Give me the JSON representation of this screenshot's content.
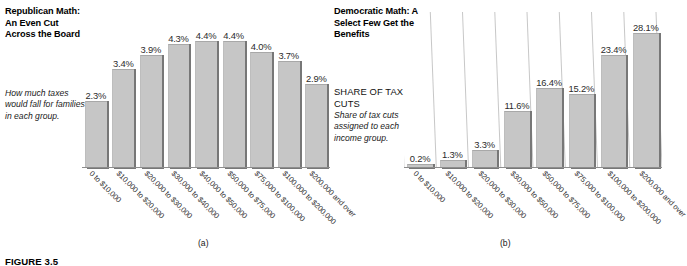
{
  "figure": {
    "caption": "FIGURE 3.5"
  },
  "panel_a": {
    "title": "Republican Math: An Even Cut Across the Board",
    "note": "How much taxes would fall for families in each group.",
    "subcaption": "(a)"
  },
  "panel_b": {
    "title": "Democratic Math: A Select Few Get the Benefits",
    "share_label": "SHARE OF TAX CUTS",
    "note": "Share of tax cuts assigned to each income group.",
    "subcaption": "(b)"
  },
  "chart_data": [
    {
      "type": "bar",
      "title": "Republican Math: An Even Cut Across the Board",
      "xlabel": "",
      "ylabel": "",
      "ylim": [
        0,
        5.0
      ],
      "grid": false,
      "legend": "none",
      "categories": [
        "0 to $10,000",
        "$10,000 to $20,000",
        "$20,000 to $30,000",
        "$30,000 to $40,000",
        "$40,000 to $50,000",
        "$50,000 to $75,000",
        "$75,000 to $100,000",
        "$100,000 to $200,000",
        "$200,000 and over"
      ],
      "values": [
        2.3,
        3.4,
        3.9,
        4.3,
        4.4,
        4.4,
        4.0,
        3.7,
        2.9
      ],
      "labels": [
        "2.3%",
        "3.4%",
        "3.9%",
        "4.3%",
        "4.4%",
        "4.4%",
        "4.0%",
        "3.7%",
        "2.9%"
      ],
      "bar_color": "#c6c6c6",
      "shadow_color": "#777777"
    },
    {
      "type": "bar",
      "title": "Democratic Math: A Select Few Get the Benefits",
      "xlabel": "",
      "ylabel": "SHARE OF TAX CUTS",
      "ylim": [
        0,
        30.0
      ],
      "grid": true,
      "legend": "none",
      "categories": [
        "0 to $10,000",
        "$10,000 to $20,000",
        "$20,000 to $30,000",
        "$30,000 to $50,000",
        "$50,000 to $75,000",
        "$75,000 to $100,000",
        "$100,000 to $200,000",
        "$200,000 and over"
      ],
      "values": [
        0.2,
        1.3,
        3.3,
        11.6,
        16.4,
        15.2,
        23.4,
        28.1
      ],
      "labels": [
        "0.2%",
        "1.3%",
        "3.3%",
        "11.6%",
        "16.4%",
        "15.2%",
        "23.4%",
        "28.1%"
      ],
      "bar_color": "#c6c6c6",
      "shadow_color": "#777777"
    }
  ]
}
